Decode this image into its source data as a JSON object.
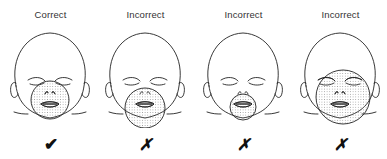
{
  "panels": [
    {
      "label": "Correct",
      "mark": "✔",
      "result": "correct",
      "mask": {
        "cx": 48,
        "cy": 72,
        "r": 19
      }
    },
    {
      "label": "Incorrect",
      "mark": "✗",
      "result": "incorrect",
      "mask": {
        "cx": 48,
        "cy": 80,
        "r": 20
      }
    },
    {
      "label": "Incorrect",
      "mark": "✗",
      "result": "incorrect",
      "mask": {
        "cx": 48,
        "cy": 79,
        "r": 13
      }
    },
    {
      "label": "Incorrect",
      "mark": "✗",
      "result": "incorrect",
      "mask": {
        "cx": 51,
        "cy": 69,
        "r": 27
      }
    }
  ],
  "colors": {
    "line": "#222222",
    "dots": "#777777",
    "background": "#ffffff"
  }
}
